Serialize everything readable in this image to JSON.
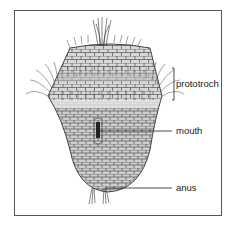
{
  "figure": {
    "labels": {
      "prototroch": "prototroch",
      "mouth": "mouth",
      "anus": "anus"
    },
    "colors": {
      "body_fill": "#d6d6d6",
      "cell_line": "#333333",
      "frame": "#555555",
      "text": "#222222"
    }
  }
}
